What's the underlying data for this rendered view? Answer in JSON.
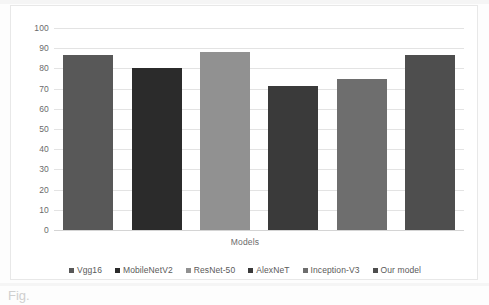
{
  "chart_data": {
    "type": "bar",
    "title": "",
    "subtitle": "",
    "xlabel": "Models",
    "ylabel": "",
    "categories": [
      "Vgg16",
      "MobileNetV2",
      "ResNet-50",
      "AlexNeT",
      "Inception-V3",
      "Our model"
    ],
    "values": [
      86.5,
      80,
      88,
      71.5,
      75,
      86.5
    ],
    "ylim": [
      0,
      100
    ],
    "ytick_labels": [
      "100",
      "90",
      "80",
      "70",
      "60",
      "50",
      "40",
      "30",
      "20",
      "10",
      "0"
    ],
    "ytick_values": [
      100,
      90,
      80,
      70,
      60,
      50,
      40,
      30,
      20,
      10,
      0
    ],
    "grid": true,
    "legend_position": "bottom",
    "bar_colors": [
      "#585858",
      "#2b2b2b",
      "#919191",
      "#3a3a3a",
      "#6e6e6e",
      "#4e4e4e"
    ],
    "legend": [
      {
        "label": "Vgg16",
        "color": "#585858"
      },
      {
        "label": "MobileNetV2",
        "color": "#2b2b2b"
      },
      {
        "label": "ResNet-50",
        "color": "#919191"
      },
      {
        "label": "AlexNeT",
        "color": "#3a3a3a"
      },
      {
        "label": "Inception-V3",
        "color": "#6e6e6e"
      },
      {
        "label": "Our model",
        "color": "#4e4e4e"
      }
    ]
  },
  "caption": {
    "fragment": "Fig."
  },
  "colors": {
    "gridline": "#e3e3e3",
    "axis_text": "#6b6b6b",
    "legend_text": "#5a5a5a",
    "card_border": "#e8e8e8",
    "background": "#ffffff"
  }
}
